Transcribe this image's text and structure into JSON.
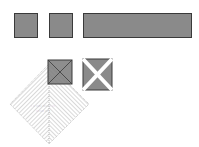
{
  "colors": {
    "fill": "#8a8a8a",
    "fill_dark": "#6e6e6e",
    "stroke": "#3a3a3a",
    "hatch": "#b0b0b0",
    "background": "#ffffff"
  },
  "shapes": {
    "square_1": "square",
    "square_2": "square",
    "bar": "rectangle",
    "overlay_square": "square-with-diagonals",
    "cross_square": "square-with-x",
    "diamond": "hatched-diamond"
  },
  "diamond_text": {
    "line1": "· ·· ······ ········· ···",
    "line2": "········ ···· ·"
  }
}
